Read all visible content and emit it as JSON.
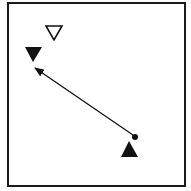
{
  "diagram": {
    "frame": {
      "x": 8,
      "y": 3,
      "width": 177,
      "height": 183,
      "stroke": "#1a1a1a"
    },
    "markers": [
      {
        "name": "hollow-down-triangle",
        "shape": "triangle-down",
        "filled": false,
        "points": "46,26 62,26 54,40"
      },
      {
        "name": "filled-down-triangle",
        "shape": "triangle-down",
        "filled": true,
        "points": "25,47 42,47 33,62"
      },
      {
        "name": "filled-up-triangle",
        "shape": "triangle-up",
        "filled": true,
        "points": "129,141 138,157 121,157"
      }
    ],
    "dot": {
      "cx": 135,
      "cy": 137,
      "r": 3
    },
    "arrow": {
      "from": [
        133,
        135
      ],
      "to": [
        35,
        68
      ]
    },
    "colors": {
      "ink": "#111111",
      "background": "#ffffff"
    }
  }
}
